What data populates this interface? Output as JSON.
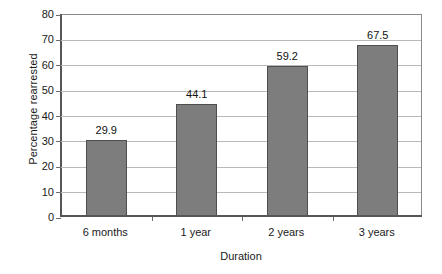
{
  "chart_data": {
    "type": "bar",
    "title": "",
    "xlabel": "Duration",
    "ylabel": "Percentage rearrested",
    "categories": [
      "6 months",
      "1 year",
      "2 years",
      "3 years"
    ],
    "values": [
      29.9,
      44.1,
      59.2,
      67.5
    ],
    "value_labels": [
      "29.9",
      "44.1",
      "59.2",
      "67.5"
    ],
    "ylim": [
      0,
      80
    ],
    "yticks": [
      0,
      10,
      20,
      30,
      40,
      50,
      60,
      70,
      80
    ],
    "ytick_labels": [
      "0",
      "10",
      "20",
      "30",
      "40",
      "50",
      "60",
      "70",
      "80"
    ],
    "grid": "horizontal",
    "legend": "none",
    "bar_color": "#7d7d7d",
    "bar_border_color": "#4f4f4f",
    "gridline_color": "#b9b9b9",
    "axis_color": "#565656",
    "background_color": "#ffffff"
  }
}
